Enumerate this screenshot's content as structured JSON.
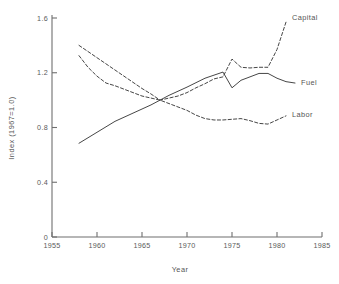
{
  "chart_data": {
    "type": "line",
    "title": "",
    "xlabel": "Year",
    "ylabel": "Index (1967=1.0)",
    "xlim": [
      1955,
      1985
    ],
    "ylim": [
      0,
      1.6
    ],
    "xticks": [
      "1955",
      "1960",
      "1965",
      "1970",
      "1975",
      "1980",
      "1985"
    ],
    "xtick_values": [
      1955,
      1960,
      1965,
      1970,
      1975,
      1980,
      1985
    ],
    "yticks": [
      "0",
      "0.4",
      "0.8",
      "1.2",
      "1.6"
    ],
    "ytick_values": [
      0,
      0.4,
      0.8,
      1.2,
      1.6
    ],
    "grid": false,
    "legend_position": "inline-right-of-curve-ends",
    "series": [
      {
        "name": "Capital",
        "label": "Capital",
        "style": "dashed",
        "x": [
          1958,
          1959,
          1960,
          1961,
          1962,
          1963,
          1964,
          1965,
          1966,
          1967,
          1968,
          1969,
          1970,
          1971,
          1972,
          1973,
          1974,
          1975,
          1976,
          1977,
          1978,
          1979,
          1980,
          1981
        ],
        "values": [
          1.4,
          1.355,
          1.31,
          1.265,
          1.22,
          1.175,
          1.13,
          1.085,
          1.045,
          1.0,
          1.015,
          1.03,
          1.055,
          1.09,
          1.12,
          1.155,
          1.17,
          1.3,
          1.24,
          1.235,
          1.24,
          1.24,
          1.37,
          1.57
        ]
      },
      {
        "name": "Fuel",
        "label": "Fuel",
        "style": "solid",
        "x": [
          1958,
          1960,
          1962,
          1964,
          1966,
          1967,
          1968,
          1970,
          1972,
          1974,
          1975,
          1976,
          1977,
          1978,
          1979,
          1980,
          1981,
          1982
        ],
        "values": [
          0.685,
          0.765,
          0.845,
          0.905,
          0.965,
          1.0,
          1.035,
          1.095,
          1.16,
          1.205,
          1.09,
          1.145,
          1.17,
          1.195,
          1.195,
          1.16,
          1.135,
          1.125
        ]
      },
      {
        "name": "Labor",
        "label": "Labor",
        "style": "dashed",
        "x": [
          1958,
          1959,
          1960,
          1961,
          1962,
          1963,
          1964,
          1965,
          1966,
          1967,
          1968,
          1969,
          1970,
          1971,
          1972,
          1973,
          1974,
          1975,
          1976,
          1977,
          1978,
          1979,
          1980,
          1981
        ],
        "values": [
          1.325,
          1.24,
          1.175,
          1.125,
          1.105,
          1.08,
          1.055,
          1.03,
          1.015,
          1.0,
          0.975,
          0.95,
          0.925,
          0.89,
          0.865,
          0.855,
          0.855,
          0.86,
          0.865,
          0.85,
          0.83,
          0.825,
          0.855,
          0.885
        ]
      }
    ]
  },
  "axes": {
    "ylabel_text": "Index (1967=1.0)",
    "xlabel_text": "Year"
  }
}
